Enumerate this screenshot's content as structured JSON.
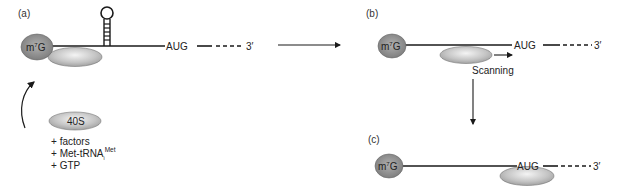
{
  "panels": {
    "a": {
      "label": "(a)",
      "cap": "m7G",
      "cap_base": "m",
      "cap_sup": "7",
      "cap_tail": "G",
      "start_codon": "AUG",
      "three_prime": "3′",
      "structure": "stem-loop hairpin"
    },
    "b": {
      "label": "(b)",
      "cap_base": "m",
      "cap_sup": "7",
      "cap_tail": "G",
      "start_codon": "AUG",
      "three_prime": "3′",
      "movement_label": "Scanning"
    },
    "c": {
      "label": "(c)",
      "cap_base": "m",
      "cap_sup": "7",
      "cap_tail": "G",
      "start_codon": "AUG",
      "three_prime": "3′"
    }
  },
  "subunit": {
    "label": "40S",
    "additions": [
      {
        "prefix": "+",
        "text": "factors"
      },
      {
        "prefix": "+",
        "text": "Met-tRNA",
        "sub": "i",
        "sup": "Met"
      },
      {
        "prefix": "+",
        "text": "GTP"
      }
    ]
  },
  "colors": {
    "cap_fill": "#8c8c8c",
    "ribosome_fill": "#b5b5b5",
    "ribosome_highlight": "#f2f2f2",
    "line": "#1a1a1a"
  }
}
